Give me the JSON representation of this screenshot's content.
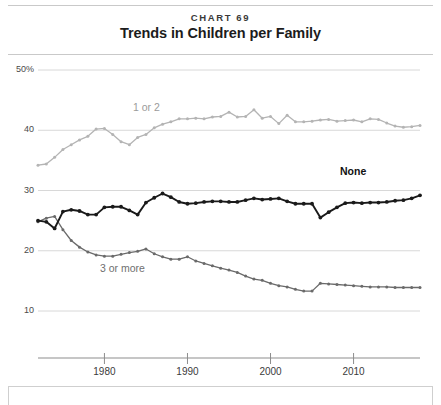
{
  "header": {
    "chart_number": "CHART 69",
    "title": "Trends in Children per Family"
  },
  "axes": {
    "y_ticks": [
      "50%",
      "40",
      "30",
      "20",
      "10"
    ],
    "x_ticks": [
      "1980",
      "1990",
      "2000",
      "2010"
    ]
  },
  "annotations": {
    "one_or_two": "1 or 2",
    "none": "None",
    "three_or_more": "3 or more"
  },
  "colors": {
    "one_or_two": "#b4b4b4",
    "none": "#1a1a1a",
    "three_or_more": "#6a6a6a",
    "grid": "#d8d8d8",
    "axis": "#8d8d8d",
    "rule": "#c9c9c9"
  },
  "chart_data": {
    "type": "line",
    "title": "Trends in Children per Family",
    "subtitle": "CHART 69",
    "xlabel": "",
    "ylabel": "",
    "xlim": [
      1972,
      2018
    ],
    "ylim": [
      5,
      52
    ],
    "ytick_values": [
      50,
      40,
      30,
      20,
      10
    ],
    "ytick_labels": [
      "50%",
      "40",
      "30",
      "20",
      "10"
    ],
    "xtick_values": [
      1980,
      1990,
      2000,
      2010
    ],
    "xtick_labels": [
      "1980",
      "1990",
      "2000",
      "2010"
    ],
    "grid": "horizontal",
    "legend": "inline-labels",
    "markers": true,
    "x": [
      1972,
      1973,
      1974,
      1975,
      1976,
      1977,
      1978,
      1979,
      1980,
      1981,
      1982,
      1983,
      1984,
      1985,
      1986,
      1987,
      1988,
      1989,
      1990,
      1991,
      1992,
      1993,
      1994,
      1995,
      1996,
      1997,
      1998,
      1999,
      2000,
      2001,
      2002,
      2003,
      2004,
      2005,
      2006,
      2007,
      2008,
      2009,
      2010,
      2011,
      2012,
      2013,
      2014,
      2015,
      2016,
      2017,
      2018
    ],
    "series": [
      {
        "name": "1 or 2",
        "color": "#b4b4b4",
        "values": [
          34.2,
          34.4,
          35.5,
          36.8,
          37.6,
          38.4,
          39.0,
          40.2,
          40.3,
          39.3,
          38.1,
          37.6,
          38.8,
          39.3,
          40.4,
          41.0,
          41.4,
          41.9,
          41.9,
          42.0,
          41.9,
          42.2,
          42.3,
          43.0,
          42.2,
          42.3,
          43.4,
          42.0,
          42.3,
          41.1,
          42.5,
          41.4,
          41.4,
          41.5,
          41.7,
          41.8,
          41.5,
          41.6,
          41.7,
          41.4,
          41.9,
          41.8,
          41.2,
          40.7,
          40.5,
          40.6,
          40.8
        ]
      },
      {
        "name": "None",
        "color": "#1a1a1a",
        "values": [
          25.0,
          24.8,
          23.7,
          26.5,
          26.8,
          26.6,
          26.0,
          26.0,
          27.2,
          27.3,
          27.3,
          26.7,
          26.0,
          28.0,
          28.8,
          29.5,
          28.9,
          28.1,
          27.8,
          27.9,
          28.1,
          28.2,
          28.2,
          28.1,
          28.1,
          28.4,
          28.7,
          28.5,
          28.6,
          28.7,
          28.2,
          27.8,
          27.8,
          27.8,
          25.5,
          26.4,
          27.2,
          27.9,
          28.0,
          27.9,
          28.0,
          28.0,
          28.1,
          28.3,
          28.4,
          28.7,
          29.2
        ]
      },
      {
        "name": "3 or more",
        "color": "#6a6a6a",
        "values": [
          24.8,
          25.4,
          25.7,
          23.5,
          21.7,
          20.6,
          19.8,
          19.3,
          19.1,
          19.1,
          19.4,
          19.7,
          19.9,
          20.3,
          19.5,
          19.0,
          18.6,
          18.6,
          19.0,
          18.3,
          17.9,
          17.5,
          17.1,
          16.8,
          16.4,
          15.8,
          15.3,
          15.1,
          14.6,
          14.2,
          14.0,
          13.6,
          13.3,
          13.3,
          14.6,
          14.5,
          14.4,
          14.3,
          14.2,
          14.1,
          14.0,
          14.0,
          14.0,
          13.9,
          13.9,
          13.9,
          13.9
        ]
      }
    ]
  }
}
